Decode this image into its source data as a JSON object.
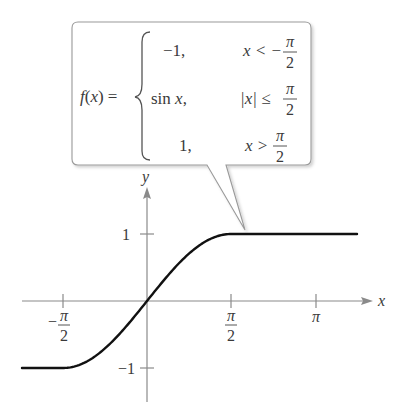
{
  "chart_data": {
    "type": "line",
    "title": "",
    "xlabel": "x",
    "ylabel": "y",
    "xlim": [
      -2.6,
      3.9
    ],
    "ylim": [
      -1.3,
      1.4
    ],
    "grid": false,
    "legend": null,
    "x_ticks": [
      {
        "value": -1.5708,
        "label_num": "π",
        "label_den": "2",
        "sign": "−"
      },
      {
        "value": 1.5708,
        "label_num": "π",
        "label_den": "2",
        "sign": ""
      },
      {
        "value": 3.1416,
        "label": "π"
      }
    ],
    "y_ticks": [
      {
        "value": 1,
        "label": "1"
      },
      {
        "value": -1,
        "label": "−1"
      }
    ],
    "series": [
      {
        "name": "f(x)",
        "description": "piecewise: -1 for x < -π/2; sin x for |x| ≤ π/2; 1 for x > π/2",
        "x": [
          -2.5,
          -1.5708,
          -1.2,
          -0.8,
          -0.4,
          0,
          0.4,
          0.8,
          1.2,
          1.5708,
          3.8
        ],
        "y": [
          -1,
          -1,
          -0.932,
          -0.717,
          -0.389,
          0,
          0.389,
          0.717,
          0.932,
          1,
          1
        ]
      }
    ],
    "annotation": {
      "type": "callout",
      "lhs": "f(x) =",
      "cases": [
        {
          "value": "−1,",
          "condition_lhs": "x < −",
          "condition_num": "π",
          "condition_den": "2"
        },
        {
          "value": "sin x,",
          "condition_lhs": "|x| ≤",
          "condition_num": "π",
          "condition_den": "2"
        },
        {
          "value": "1,",
          "condition_lhs": "x >",
          "condition_num": "π",
          "condition_den": "2"
        }
      ]
    }
  },
  "colors": {
    "axis": "#8a8a8a",
    "curve": "#111111",
    "callout_border": "#9a9a9a",
    "text": "#3a3a3a"
  }
}
